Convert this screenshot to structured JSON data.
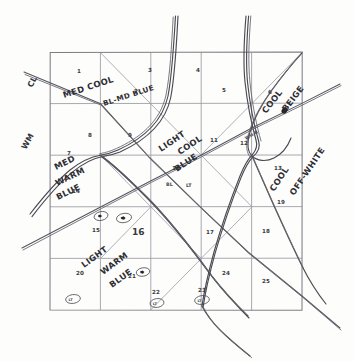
{
  "figure": {
    "medium": "pencil on paper",
    "grid": {
      "rows": 5,
      "cols": 5,
      "cell_count": 25
    },
    "axis_labels": {
      "top_left_upper": "CL",
      "top_left_lower": "WM"
    },
    "region_labels": [
      {
        "id": "med-cool-blmd-blue",
        "line1": "MED COOL",
        "line2": "BL-MD BLUE"
      },
      {
        "id": "cool-beige",
        "line1": "COOL",
        "line2": "BEIGE"
      },
      {
        "id": "light-cool-blue",
        "line1": "LIGHT",
        "line2": "COOL",
        "line3": "BLUE"
      },
      {
        "id": "cool-off-white",
        "line1": "COOL",
        "line2": "OFF-WHITE"
      },
      {
        "id": "med-warm-blue",
        "line1": "MED",
        "line2": "WARM",
        "line3": "BLUE"
      },
      {
        "id": "light-warm-blue",
        "line1": "LIGHT",
        "line2": "WARM",
        "line3": "BLUE"
      }
    ],
    "annotations": [
      {
        "id": "wh-b",
        "text": "WH-B"
      },
      {
        "id": "bl",
        "text": "BL"
      },
      {
        "id": "lt",
        "text": "LT"
      }
    ],
    "cell_numbers": [
      "1",
      "2",
      "3",
      "4",
      "5",
      "6",
      "7",
      "8",
      "9",
      "10",
      "11",
      "12",
      "13",
      "14",
      "15",
      "16",
      "17",
      "18",
      "19",
      "20",
      "21",
      "22",
      "23",
      "24",
      "25"
    ],
    "colors": {
      "paper": "#fdfdfc",
      "grid": "#9a9aa2",
      "frame": "#7d7d86",
      "pencil": "#4a4a52",
      "ink": "#2e2e33"
    }
  }
}
